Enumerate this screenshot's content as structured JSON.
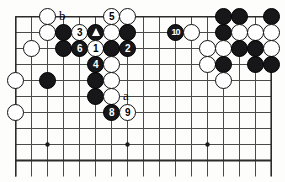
{
  "figure": {
    "kind": "go-board-diagram",
    "board": {
      "columns": 16,
      "rows": 10,
      "cell_px": 16,
      "line_color": "#4a4a4a",
      "border_color": "#2b2b2b",
      "background": "#fdfdfb",
      "star_points": [
        {
          "col": 3,
          "row": 9
        },
        {
          "col": 8,
          "row": 9
        },
        {
          "col": 13,
          "row": 9
        }
      ]
    },
    "colors": {
      "black_stone": "#17171a",
      "white_stone": "#ffffff",
      "stone_outline": "#111111",
      "label_text": "#000000"
    },
    "stones": [
      {
        "id": "w-c3r1",
        "color": "white",
        "col": 3,
        "row": 1,
        "label": ""
      },
      {
        "id": "w-c7r1",
        "color": "white",
        "col": 7,
        "row": 1,
        "label": "5",
        "is_move": true
      },
      {
        "id": "w-c8r1",
        "color": "white",
        "col": 8,
        "row": 1,
        "label": ""
      },
      {
        "id": "w-c3r2",
        "color": "white",
        "col": 3,
        "row": 2,
        "label": ""
      },
      {
        "id": "b-c4r2",
        "color": "black",
        "col": 4,
        "row": 2,
        "label": ""
      },
      {
        "id": "w-c5r2",
        "color": "white",
        "col": 5,
        "row": 2,
        "label": "3",
        "is_move": true
      },
      {
        "id": "b-c6r2",
        "color": "black",
        "col": 6,
        "row": 2,
        "label": "triangle",
        "is_mark": true
      },
      {
        "id": "w-c7r2",
        "color": "white",
        "col": 7,
        "row": 2,
        "label": ""
      },
      {
        "id": "b-c8r2",
        "color": "black",
        "col": 8,
        "row": 2,
        "label": ""
      },
      {
        "id": "b-c11r2",
        "color": "black",
        "col": 11,
        "row": 2,
        "label": "10",
        "is_move": true
      },
      {
        "id": "w-c12r2",
        "color": "white",
        "col": 12,
        "row": 2,
        "label": ""
      },
      {
        "id": "b-c14r1",
        "color": "black",
        "col": 14,
        "row": 1,
        "label": ""
      },
      {
        "id": "b-c15r1",
        "color": "black",
        "col": 15,
        "row": 1,
        "label": ""
      },
      {
        "id": "b-c17r1",
        "color": "black",
        "col": 17,
        "row": 1,
        "label": ""
      },
      {
        "id": "b-c14r2",
        "color": "black",
        "col": 14,
        "row": 2,
        "label": ""
      },
      {
        "id": "w-c15r2",
        "color": "white",
        "col": 15,
        "row": 2,
        "label": ""
      },
      {
        "id": "w-c16r2",
        "color": "white",
        "col": 16,
        "row": 2,
        "label": ""
      },
      {
        "id": "w-c17r2",
        "color": "white",
        "col": 17,
        "row": 2,
        "label": ""
      },
      {
        "id": "w-c2r3",
        "color": "white",
        "col": 2,
        "row": 3,
        "label": ""
      },
      {
        "id": "b-c4r3",
        "color": "black",
        "col": 4,
        "row": 3,
        "label": ""
      },
      {
        "id": "b-c5r3",
        "color": "black",
        "col": 5,
        "row": 3,
        "label": "6",
        "is_move": true
      },
      {
        "id": "w-c6r3",
        "color": "white",
        "col": 6,
        "row": 3,
        "label": "1",
        "is_move": true
      },
      {
        "id": "b-c7r3",
        "color": "black",
        "col": 7,
        "row": 3,
        "label": ""
      },
      {
        "id": "b-c8r3",
        "color": "black",
        "col": 8,
        "row": 3,
        "label": "2",
        "is_move": true
      },
      {
        "id": "w-c13r3",
        "color": "white",
        "col": 13,
        "row": 3,
        "label": ""
      },
      {
        "id": "w-c14r3",
        "color": "white",
        "col": 14,
        "row": 3,
        "label": ""
      },
      {
        "id": "b-c15r3",
        "color": "black",
        "col": 15,
        "row": 3,
        "label": ""
      },
      {
        "id": "b-c16r3",
        "color": "black",
        "col": 16,
        "row": 3,
        "label": ""
      },
      {
        "id": "w-c17r3",
        "color": "white",
        "col": 17,
        "row": 3,
        "label": ""
      },
      {
        "id": "b-c6r4",
        "color": "black",
        "col": 6,
        "row": 4,
        "label": "4",
        "is_move": true
      },
      {
        "id": "w-c7r4",
        "color": "white",
        "col": 7,
        "row": 4,
        "label": ""
      },
      {
        "id": "w-c13r4",
        "color": "white",
        "col": 13,
        "row": 4,
        "label": ""
      },
      {
        "id": "b-c14r4",
        "color": "black",
        "col": 14,
        "row": 4,
        "label": ""
      },
      {
        "id": "b-c16r4",
        "color": "black",
        "col": 16,
        "row": 4,
        "label": ""
      },
      {
        "id": "b-c17r4",
        "color": "black",
        "col": 17,
        "row": 4,
        "label": ""
      },
      {
        "id": "w-c1r5",
        "color": "white",
        "col": 1,
        "row": 5,
        "label": ""
      },
      {
        "id": "b-c3r5",
        "color": "black",
        "col": 3,
        "row": 5,
        "label": ""
      },
      {
        "id": "b-c6r5",
        "color": "black",
        "col": 6,
        "row": 5,
        "label": ""
      },
      {
        "id": "w-c7r5",
        "color": "white",
        "col": 7,
        "row": 5,
        "label": ""
      },
      {
        "id": "w-c14r5",
        "color": "white",
        "col": 14,
        "row": 5,
        "label": ""
      },
      {
        "id": "b-c6r6",
        "color": "black",
        "col": 6,
        "row": 6,
        "label": ""
      },
      {
        "id": "w-c7r6",
        "color": "white",
        "col": 7,
        "row": 6,
        "label": ""
      },
      {
        "id": "w-c1r7",
        "color": "white",
        "col": 1,
        "row": 7,
        "label": ""
      },
      {
        "id": "b-c7r7",
        "color": "black",
        "col": 7,
        "row": 7,
        "label": "8",
        "is_move": true
      },
      {
        "id": "w-c8r7",
        "color": "white",
        "col": 8,
        "row": 7,
        "label": "9",
        "is_move": true
      }
    ],
    "point_labels": [
      {
        "id": "label-b",
        "text": "b",
        "col": 4,
        "row": 1
      },
      {
        "id": "label-a",
        "text": "a",
        "col": 8,
        "row": 6
      }
    ],
    "move_sequence": [
      "1",
      "2",
      "3",
      "4",
      "5",
      "6",
      "8",
      "9",
      "10"
    ],
    "marked_stone_symbol": "triangle"
  }
}
